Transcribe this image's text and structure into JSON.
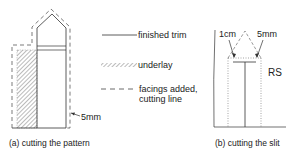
{
  "figure_a": {
    "caption": "(a) cutting the pattern",
    "dimension_label": "5mm"
  },
  "legend": {
    "items": [
      {
        "line_style": "solid",
        "label": "finished trim"
      },
      {
        "line_style": "hatched",
        "label": "underlay"
      },
      {
        "line_style": "dashed",
        "label_line1": "facings added,",
        "label_line2": "cutting line"
      }
    ]
  },
  "figure_b": {
    "caption": "(b) cutting the slit",
    "dimension_left": "1cm",
    "dimension_right": "5mm",
    "side_label": "RS"
  },
  "colors": {
    "line": "#333333",
    "hatch": "#555555",
    "background": "#ffffff"
  }
}
